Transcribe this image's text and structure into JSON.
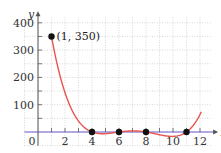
{
  "chart_data": {
    "type": "line",
    "title": "",
    "xlabel": "x",
    "ylabel": "y",
    "xlim": [
      -1,
      12.9
    ],
    "ylim": [
      -50,
      420
    ],
    "grid": true,
    "x_ticks": [
      0,
      2,
      4,
      6,
      8,
      10,
      12
    ],
    "x_tick_labels": [
      "0",
      "2",
      "4",
      "6",
      "8",
      "10",
      "12"
    ],
    "y_ticks": [
      100,
      200,
      300,
      400
    ],
    "y_tick_labels": [
      "100",
      "200",
      "300",
      "400"
    ],
    "series": [
      {
        "name": "f(x) = (x-4)(x-6)(x-8)(x-11)/3",
        "color": "#e8554e",
        "x_range": [
          1,
          12.1
        ]
      }
    ],
    "points": [
      {
        "x": 1,
        "y": 350,
        "label": "(1, 350)"
      },
      {
        "x": 4,
        "y": 0,
        "label": ""
      },
      {
        "x": 6,
        "y": 0,
        "label": ""
      },
      {
        "x": 8,
        "y": 0,
        "label": ""
      },
      {
        "x": 11,
        "y": 0,
        "label": ""
      }
    ],
    "annotations": [
      {
        "text": "(1, 350)",
        "x": 1,
        "y": 350
      }
    ]
  },
  "colors": {
    "curve": "#e8554e",
    "axis": "#555555",
    "grid": "#bdbdbd",
    "x_axis_tint": "#6a5acd",
    "point": "#111111"
  }
}
